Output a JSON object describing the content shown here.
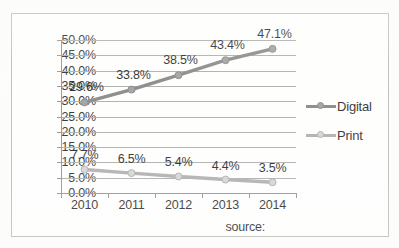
{
  "chart_data": {
    "type": "line",
    "title": "",
    "xlabel": "",
    "ylabel": "",
    "categories": [
      "2010",
      "2011",
      "2012",
      "2013",
      "2014"
    ],
    "ylim": [
      0,
      50
    ],
    "ytick_step": 5,
    "ytick_labels": [
      "0.0%",
      "5.0%",
      "10.0%",
      "15.0%",
      "20.0%",
      "25.0%",
      "30.0%",
      "35.0%",
      "40.0%",
      "45.0%",
      "50.0%"
    ],
    "grid": true,
    "legend_position": "right",
    "series": [
      {
        "name": "Digital",
        "color": "#808080",
        "marker_color": "#9a9a9a",
        "values": [
          29.6,
          33.8,
          38.5,
          43.4,
          47.1
        ],
        "data_labels": [
          "29.6%",
          "33.8%",
          "38.5%",
          "43.4%",
          "47.1%"
        ]
      },
      {
        "name": "Print",
        "color": "#a9a9a9",
        "marker_color": "#d2d2d2",
        "values": [
          7.7,
          6.5,
          5.4,
          4.4,
          3.5
        ],
        "data_labels": [
          "7.7%",
          "6.5%",
          "5.4%",
          "4.4%",
          "3.5%"
        ]
      }
    ],
    "annotations": {
      "source": "source:"
    }
  }
}
